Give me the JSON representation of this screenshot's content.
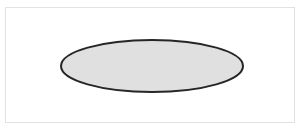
{
  "figure": {
    "background_color": "#ffffff",
    "canvas": {
      "width": 303,
      "height": 135
    },
    "frame": {
      "name": "figure-border",
      "x": 5,
      "y": 7,
      "width": 290,
      "height": 116,
      "stroke_color": "#e2e2e2",
      "stroke_width": 1,
      "fill_color": "#ffffff"
    },
    "shapes": [
      {
        "type": "ellipse",
        "name": "gray-ellipse",
        "center_x": 152,
        "center_y": 66,
        "radius_x": 91,
        "radius_y": 26,
        "fill_color": "#e0e0e0",
        "stroke_color": "#262626",
        "stroke_width": 2
      }
    ],
    "labels": [],
    "annotations": []
  },
  "chart_data": {
    "type": "diagram",
    "title": "",
    "xlabel": "",
    "ylabel": "",
    "series": [],
    "categories": [],
    "values": []
  }
}
